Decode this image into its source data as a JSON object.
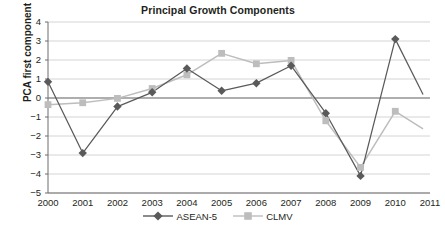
{
  "chart_data": {
    "type": "line",
    "title": "Principal Growth Components",
    "xlabel": "",
    "ylabel": "PCA first component",
    "categories": [
      "2000",
      "2001",
      "2002",
      "2003",
      "2004",
      "2005",
      "2006",
      "2007",
      "2008",
      "2009",
      "2010",
      "2011"
    ],
    "x": [
      2000,
      2001,
      2002,
      2003,
      2004,
      2005,
      2006,
      2007,
      2008,
      2009,
      2010,
      2011
    ],
    "ylim": [
      -5,
      4
    ],
    "yticks": [
      4,
      3,
      2,
      1,
      0,
      -1,
      -2,
      -3,
      -4,
      -5
    ],
    "ytick_labels": [
      "4",
      "3",
      "2",
      "1",
      "0",
      "−1",
      "−2",
      "−3",
      "−4",
      "−5"
    ],
    "grid": true,
    "legend_position": "bottom",
    "series": [
      {
        "name": "ASEAN-5",
        "color": "#5a5a5a",
        "marker": "diamond",
        "values": [
          0.85,
          -2.9,
          -0.45,
          0.3,
          1.55,
          0.38,
          0.78,
          1.7,
          -0.8,
          -4.1,
          3.1,
          null
        ],
        "truncated_end_value": -0.55
      },
      {
        "name": "CLMV",
        "color": "#bdbdbd",
        "marker": "square",
        "values": [
          -0.35,
          -0.25,
          -0.02,
          0.5,
          1.22,
          2.35,
          1.8,
          1.98,
          -1.2,
          -3.65,
          -0.7,
          null
        ],
        "truncated_end_value": -1.85
      }
    ]
  },
  "legend": {
    "items": [
      {
        "label": "ASEAN-5",
        "marker": "diamond-marker-icon",
        "color": "#5a5a5a"
      },
      {
        "label": "CLMV",
        "marker": "square-marker-icon",
        "color": "#bdbdbd"
      }
    ]
  },
  "colors": {
    "asean5": "#5a5a5a",
    "clmv": "#bdbdbd",
    "grid": "#c9c9c9",
    "axis": "#6d6d6d",
    "zero_line": "#5e5e5e",
    "text": "#231f20",
    "background": "#ffffff"
  }
}
